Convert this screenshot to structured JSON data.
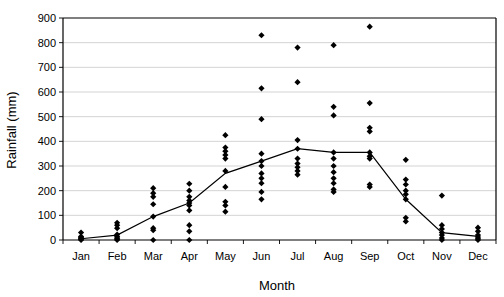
{
  "chart_data": {
    "type": "scatter",
    "title": "",
    "xlabel": "Month",
    "ylabel": "Rainfall (mm)",
    "categories": [
      "Jan",
      "Feb",
      "Mar",
      "Apr",
      "May",
      "Jun",
      "Jul",
      "Aug",
      "Sep",
      "Oct",
      "Nov",
      "Dec"
    ],
    "ylim": [
      0,
      900
    ],
    "ytick_step": 100,
    "yticks": [
      0,
      100,
      200,
      300,
      400,
      500,
      600,
      700,
      800,
      900
    ],
    "ytick_labels": [
      "0",
      "100",
      "200",
      "300",
      "400",
      "500",
      "600",
      "700",
      "800",
      "900"
    ],
    "xlim_categories": 12,
    "grid": "horizontal",
    "legend": "none",
    "marker": "black-diamond",
    "series": [
      {
        "name": "Monthly rainfall observations",
        "type": "scatter",
        "points": [
          {
            "x": "Jan",
            "values": [
              0,
              3,
              6,
              10,
              14,
              30
            ]
          },
          {
            "x": "Feb",
            "values": [
              0,
              4,
              8,
              14,
              22,
              48,
              60,
              70
            ]
          },
          {
            "x": "Mar",
            "values": [
              0,
              40,
              48,
              95,
              145,
              175,
              190,
              210
            ]
          },
          {
            "x": "Apr",
            "values": [
              0,
              35,
              60,
              120,
              140,
              150,
              160,
              175,
              200,
              228
            ]
          },
          {
            "x": "May",
            "values": [
              115,
              140,
              155,
              215,
              280,
              330,
              345,
              360,
              375,
              425
            ]
          },
          {
            "x": "Jun",
            "values": [
              165,
              195,
              230,
              250,
              270,
              300,
              320,
              350,
              490,
              615,
              830
            ]
          },
          {
            "x": "Jul",
            "values": [
              265,
              280,
              295,
              310,
              330,
              370,
              405,
              640,
              780
            ]
          },
          {
            "x": "Aug",
            "values": [
              195,
              205,
              230,
              250,
              275,
              300,
              330,
              355,
              505,
              540,
              790
            ]
          },
          {
            "x": "Sep",
            "values": [
              215,
              225,
              330,
              340,
              355,
              440,
              455,
              555,
              865
            ]
          },
          {
            "x": "Oct",
            "values": [
              75,
              90,
              165,
              185,
              200,
              225,
              245,
              325
            ]
          },
          {
            "x": "Nov",
            "values": [
              0,
              8,
              20,
              30,
              45,
              60,
              180
            ]
          },
          {
            "x": "Dec",
            "values": [
              0,
              5,
              12,
              20,
              35,
              50
            ]
          }
        ]
      },
      {
        "name": "Mean monthly rainfall",
        "type": "line",
        "categories": [
          "Jan",
          "Feb",
          "Mar",
          "Apr",
          "May",
          "Jun",
          "Jul",
          "Aug",
          "Sep",
          "Oct",
          "Nov",
          "Dec"
        ],
        "values": [
          5,
          20,
          95,
          150,
          270,
          320,
          370,
          355,
          355,
          165,
          30,
          15
        ]
      }
    ],
    "colors": {
      "marker": "#000000",
      "line": "#000000",
      "grid": "#c8c8c8",
      "axis": "#000000",
      "background": "#ffffff"
    }
  }
}
